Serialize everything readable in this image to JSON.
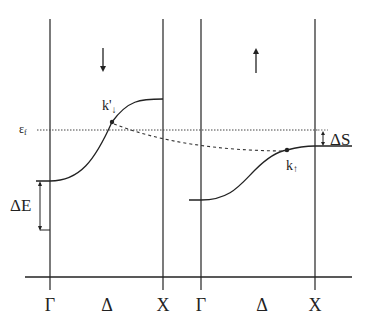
{
  "diagram": {
    "type": "band-structure-spin-split",
    "colors": {
      "line": "#222222",
      "background": "#ffffff"
    },
    "left_panel": {
      "spin": "down",
      "spin_arrow": "↓",
      "k_point_label": "k'",
      "k_point_subscript": "↓",
      "x_labels": [
        "Γ",
        "Δ",
        "X"
      ]
    },
    "right_panel": {
      "spin": "up",
      "spin_arrow": "↑",
      "k_point_label": "k",
      "k_point_subscript": "↑",
      "x_labels": [
        "Γ",
        "Δ",
        "X"
      ]
    },
    "fermi_level_label": "ε",
    "fermi_level_subscript": "f",
    "delta_e_label": "ΔE",
    "delta_s_label": "ΔS"
  }
}
